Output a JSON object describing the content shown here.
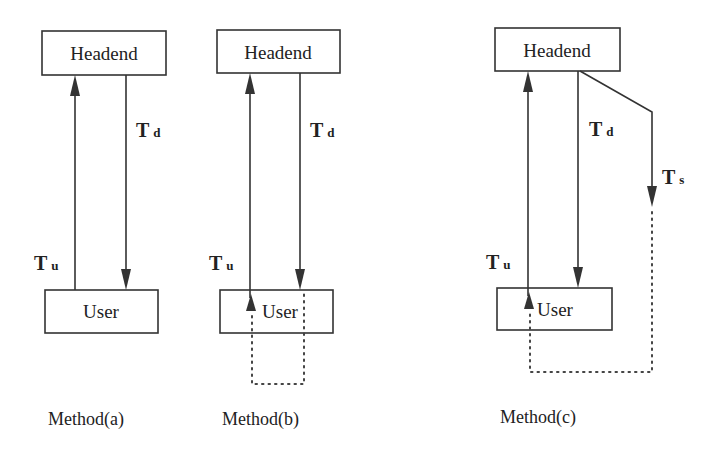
{
  "diagram": {
    "panels": [
      {
        "id": "a",
        "caption": "Method(a)",
        "top_node": "Headend",
        "bottom_node": "User",
        "labels": {
          "down": {
            "main": "T",
            "sub": "d"
          },
          "up": {
            "main": "T",
            "sub": "u"
          }
        }
      },
      {
        "id": "b",
        "caption": "Method(b)",
        "top_node": "Headend",
        "bottom_node": "User",
        "labels": {
          "down": {
            "main": "T",
            "sub": "d"
          },
          "up": {
            "main": "T",
            "sub": "u"
          }
        }
      },
      {
        "id": "c",
        "caption": "Method(c)",
        "top_node": "Headend",
        "bottom_node": "User",
        "labels": {
          "down": {
            "main": "T",
            "sub": "d"
          },
          "up": {
            "main": "T",
            "sub": "u"
          },
          "side": {
            "main": "T",
            "sub": "s"
          }
        }
      }
    ]
  }
}
